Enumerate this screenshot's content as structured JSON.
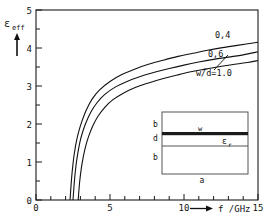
{
  "chart_data": {
    "type": "line",
    "title": "",
    "xlabel": "f /GHz",
    "ylabel": "ε_eff",
    "ylabel_symbol": "ε",
    "ylabel_sub": "eff",
    "xlim": [
      0,
      15
    ],
    "ylim": [
      0,
      5
    ],
    "xticks": [
      0,
      5,
      10,
      15
    ],
    "xticklabels": [
      "0",
      "5",
      "10",
      "15"
    ],
    "yticks": [
      0,
      1,
      2,
      3,
      4,
      5
    ],
    "yticklabels": [
      "0",
      "1",
      "2",
      "3",
      "4",
      "5"
    ],
    "x_minor_count": 5,
    "y_minor_count": 2,
    "grid": false,
    "legend_position": "inline-right",
    "series": [
      {
        "name": "0,4",
        "label": "0,4",
        "x": [
          2.3,
          2.4,
          2.5,
          2.6,
          2.75,
          2.9,
          3.1,
          3.4,
          3.8,
          4.3,
          5.0,
          5.8,
          6.7,
          7.6,
          8.6,
          9.6,
          10.6,
          11.6,
          12.6,
          13.6,
          15.0
        ],
        "y": [
          0.0,
          0.55,
          0.95,
          1.25,
          1.58,
          1.82,
          2.07,
          2.37,
          2.66,
          2.9,
          3.12,
          3.3,
          3.45,
          3.57,
          3.68,
          3.78,
          3.86,
          3.94,
          4.01,
          4.07,
          4.15
        ]
      },
      {
        "name": "0,6",
        "label": "0,6",
        "x": [
          2.5,
          2.6,
          2.7,
          2.82,
          2.97,
          3.15,
          3.38,
          3.7,
          4.12,
          4.65,
          5.35,
          6.15,
          7.05,
          8.0,
          9.0,
          10.0,
          11.0,
          12.0,
          13.0,
          14.0,
          15.0
        ],
        "y": [
          0.0,
          0.52,
          0.9,
          1.22,
          1.53,
          1.79,
          2.04,
          2.31,
          2.56,
          2.78,
          2.97,
          3.12,
          3.25,
          3.36,
          3.46,
          3.55,
          3.63,
          3.7,
          3.76,
          3.82,
          3.9
        ]
      },
      {
        "name": "w/d=1.0",
        "label": "w/d=1.0",
        "x": [
          2.85,
          2.95,
          3.07,
          3.2,
          3.38,
          3.58,
          3.85,
          4.2,
          4.65,
          5.2,
          5.9,
          6.7,
          7.6,
          8.55,
          9.55,
          10.55,
          11.55,
          12.55,
          13.55,
          14.3,
          15.0
        ],
        "y": [
          0.0,
          0.48,
          0.85,
          1.15,
          1.45,
          1.7,
          1.96,
          2.21,
          2.44,
          2.64,
          2.81,
          2.96,
          3.08,
          3.19,
          3.29,
          3.38,
          3.45,
          3.52,
          3.58,
          3.62,
          3.67
        ]
      }
    ],
    "annotations": [
      {
        "name": "curve-label-04",
        "text": "0,4",
        "x_px": 215,
        "y_px": 38
      },
      {
        "name": "curve-label-06",
        "text": "0,6",
        "x_px": 208,
        "y_px": 57
      },
      {
        "name": "curve-label-wd",
        "text": "w/d=1.0",
        "x_px": 199,
        "y_px": 75
      }
    ]
  },
  "axes": {
    "y_axis_name": "epsilon-eff",
    "x_axis_name": "frequency-ghz",
    "x_axis_arrow": "⟶"
  },
  "inset": {
    "name": "waveguide-cross-section",
    "labels": {
      "top_region": "b",
      "middle_region": "d",
      "bottom_region": "b",
      "width_bottom": "a",
      "strip_width": "w",
      "permittivity": "ε",
      "permittivity_sub": "r"
    }
  }
}
